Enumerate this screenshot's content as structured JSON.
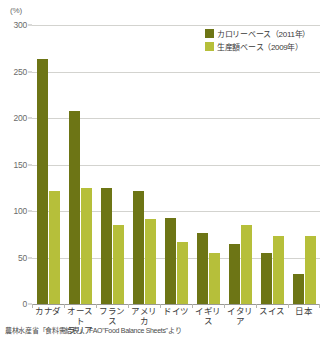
{
  "chart_data": {
    "type": "bar",
    "title": "",
    "xlabel": "",
    "ylabel": "(%)",
    "unit_label": "(%)",
    "ylim": [
      0,
      300
    ],
    "yticks": [
      300,
      250,
      200,
      150,
      100,
      50,
      0
    ],
    "grid": true,
    "legend_position": "top-right",
    "categories": [
      "カナダ",
      "オーストラリア",
      "フランス",
      "アメリカ",
      "ドイツ",
      "イギリス",
      "イタリア",
      "スイス",
      "日本"
    ],
    "category_lines": [
      [
        "カナダ"
      ],
      [
        "オースト",
        "ラリア"
      ],
      [
        "フランス"
      ],
      [
        "アメリカ"
      ],
      [
        "ドイツ"
      ],
      [
        "イギリス"
      ],
      [
        "イタリア"
      ],
      [
        "スイス"
      ],
      [
        "日本"
      ]
    ],
    "series": [
      {
        "name": "カロリーベース（2011年）",
        "color": "#6d7515",
        "values": [
          263,
          208,
          125,
          121,
          92,
          76,
          65,
          55,
          32
        ]
      },
      {
        "name": "生産額ベース（2009年）",
        "color": "#b6bf3a",
        "values": [
          121,
          125,
          85,
          91,
          67,
          55,
          85,
          73,
          73
        ]
      }
    ]
  },
  "legend": {
    "items": [
      {
        "label": "カロリーベース（2011年）",
        "color": "#6d7515"
      },
      {
        "label": "生産額ベース（2009年）",
        "color": "#b6bf3a"
      }
    ]
  },
  "source": {
    "text": "農林水産省「食料需給表」、FAO\"Food Balance Sheets\"より"
  },
  "colors": {
    "series_dark": "#6d7515",
    "series_light": "#b6bf3a",
    "gridline": "#d3d3cf",
    "axis": "#9a9a95",
    "text": "#3a3a3a",
    "tick_text": "#6b6b6b"
  }
}
